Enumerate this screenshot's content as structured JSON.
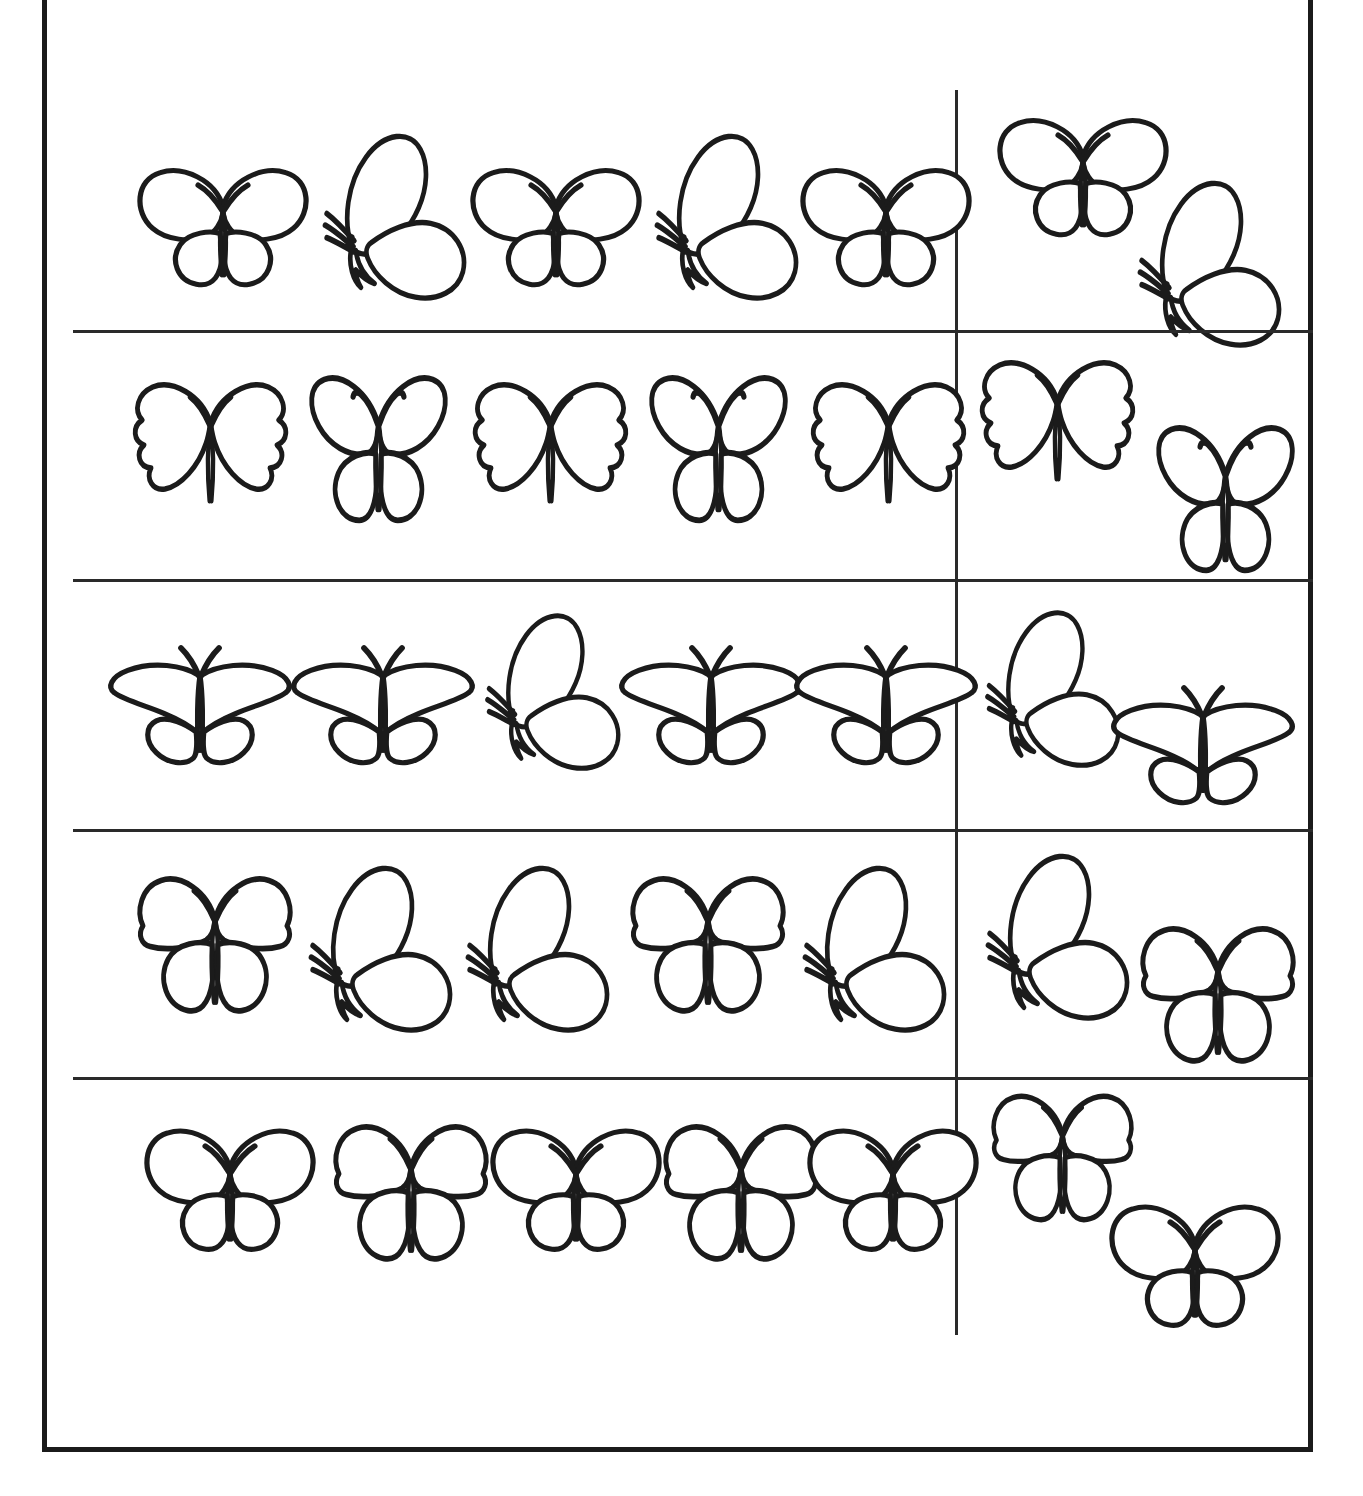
{
  "worksheet": {
    "title": "Butterfly Pattern Sorting Worksheet",
    "description": "Five-row worksheet: each row shows a sequence of five butterflies on the left and two butterflies in a separate right-hand column.",
    "sheet_color": "#1b1b1b",
    "line_color": "#2a2a2a",
    "background_color": "#ffffff",
    "rows_count": 5,
    "left_items_per_row": 5,
    "right_items_per_row": 2
  },
  "legend": {
    "shape_names": {
      "round": "round-wing-butterfly",
      "side": "side-view-butterfly",
      "scallop": "scalloped-wing-butterfly",
      "wide": "wide-flat-wing-butterfly",
      "lobed": "lobed-wing-butterfly",
      "heavy": "bottom-heavy-wing-butterfly"
    }
  },
  "rows": [
    {
      "index": 1,
      "label": "row-1",
      "top": 91,
      "height": 240,
      "left": [
        {
          "shape": "round",
          "orient": "front",
          "x": 55,
          "y": 70,
          "w": 190,
          "h": 135
        },
        {
          "shape": "side",
          "orient": "side",
          "x": 242,
          "y": 38,
          "w": 170,
          "h": 175
        },
        {
          "shape": "round",
          "orient": "front",
          "x": 388,
          "y": 70,
          "w": 190,
          "h": 135
        },
        {
          "shape": "side",
          "orient": "side",
          "x": 574,
          "y": 38,
          "w": 170,
          "h": 175
        },
        {
          "shape": "round",
          "orient": "front",
          "x": 718,
          "y": 70,
          "w": 190,
          "h": 135
        }
      ],
      "right": [
        {
          "shape": "round",
          "orient": "front",
          "x": 28,
          "y": 20,
          "w": 190,
          "h": 135
        },
        {
          "shape": "side",
          "orient": "side",
          "x": 170,
          "y": 85,
          "w": 170,
          "h": 175
        }
      ]
    },
    {
      "index": 2,
      "label": "row-2",
      "top": 334,
      "height": 243,
      "left": [
        {
          "shape": "scallop",
          "orient": "front",
          "x": 50,
          "y": 42,
          "w": 175,
          "h": 150
        },
        {
          "shape": "lobed",
          "orient": "front",
          "x": 218,
          "y": 38,
          "w": 175,
          "h": 160
        },
        {
          "shape": "scallop",
          "orient": "front",
          "x": 390,
          "y": 42,
          "w": 175,
          "h": 150
        },
        {
          "shape": "lobed",
          "orient": "front",
          "x": 558,
          "y": 38,
          "w": 175,
          "h": 160
        },
        {
          "shape": "scallop",
          "orient": "front",
          "x": 728,
          "y": 42,
          "w": 175,
          "h": 150
        }
      ],
      "right": [
        {
          "shape": "scallop",
          "orient": "front",
          "x": 10,
          "y": 20,
          "w": 175,
          "h": 150
        },
        {
          "shape": "lobed",
          "orient": "front",
          "x": 178,
          "y": 88,
          "w": 175,
          "h": 160
        }
      ]
    },
    {
      "index": 3,
      "label": "row-3",
      "top": 581,
      "height": 246,
      "left": [
        {
          "shape": "wide",
          "orient": "front",
          "x": 32,
          "y": 55,
          "w": 190,
          "h": 140
        },
        {
          "shape": "wide",
          "orient": "front",
          "x": 215,
          "y": 55,
          "w": 190,
          "h": 140
        },
        {
          "shape": "side",
          "orient": "side",
          "x": 405,
          "y": 28,
          "w": 160,
          "h": 165
        },
        {
          "shape": "wide",
          "orient": "front",
          "x": 543,
          "y": 55,
          "w": 190,
          "h": 140
        },
        {
          "shape": "wide",
          "orient": "front",
          "x": 718,
          "y": 55,
          "w": 190,
          "h": 140
        }
      ],
      "right": [
        {
          "shape": "side",
          "orient": "side",
          "x": 18,
          "y": 25,
          "w": 160,
          "h": 165
        },
        {
          "shape": "wide",
          "orient": "front",
          "x": 148,
          "y": 95,
          "w": 190,
          "h": 140
        }
      ]
    },
    {
      "index": 4,
      "label": "row-4",
      "top": 831,
      "height": 245,
      "left": [
        {
          "shape": "heavy",
          "orient": "front",
          "x": 52,
          "y": 38,
          "w": 180,
          "h": 155
        },
        {
          "shape": "side",
          "orient": "side",
          "x": 228,
          "y": 30,
          "w": 170,
          "h": 175
        },
        {
          "shape": "side",
          "orient": "side",
          "x": 385,
          "y": 30,
          "w": 170,
          "h": 175
        },
        {
          "shape": "heavy",
          "orient": "front",
          "x": 545,
          "y": 38,
          "w": 180,
          "h": 155
        },
        {
          "shape": "side",
          "orient": "side",
          "x": 722,
          "y": 30,
          "w": 170,
          "h": 175
        }
      ],
      "right": [
        {
          "shape": "side",
          "orient": "side",
          "x": 18,
          "y": 18,
          "w": 170,
          "h": 175
        },
        {
          "shape": "heavy",
          "orient": "front",
          "x": 168,
          "y": 88,
          "w": 180,
          "h": 155
        }
      ]
    },
    {
      "index": 5,
      "label": "row-5",
      "top": 1079,
      "height": 257,
      "left": [
        {
          "shape": "round",
          "orient": "front",
          "x": 62,
          "y": 42,
          "w": 190,
          "h": 140
        },
        {
          "shape": "heavy",
          "orient": "front",
          "x": 248,
          "y": 38,
          "w": 180,
          "h": 155
        },
        {
          "shape": "round",
          "orient": "front",
          "x": 408,
          "y": 42,
          "w": 190,
          "h": 140
        },
        {
          "shape": "heavy",
          "orient": "front",
          "x": 578,
          "y": 38,
          "w": 180,
          "h": 155
        },
        {
          "shape": "round",
          "orient": "front",
          "x": 725,
          "y": 42,
          "w": 190,
          "h": 140
        }
      ],
      "right": [
        {
          "shape": "heavy",
          "orient": "front",
          "x": 20,
          "y": 8,
          "w": 165,
          "h": 145
        },
        {
          "shape": "round",
          "orient": "front",
          "x": 140,
          "y": 118,
          "w": 190,
          "h": 140
        }
      ]
    }
  ],
  "dividers": {
    "rows": [
      331,
      580,
      830,
      1078
    ],
    "column_x": 908
  }
}
